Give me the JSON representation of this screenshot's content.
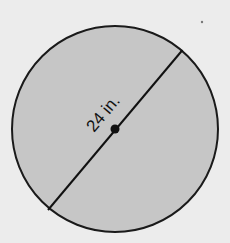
{
  "diagram": {
    "shape": "circle",
    "measurement": {
      "label": "24 in.",
      "type": "diameter"
    },
    "colors": {
      "background": "#ececec",
      "fill": "#c6c6c6",
      "stroke": "#1a1a1a"
    }
  }
}
